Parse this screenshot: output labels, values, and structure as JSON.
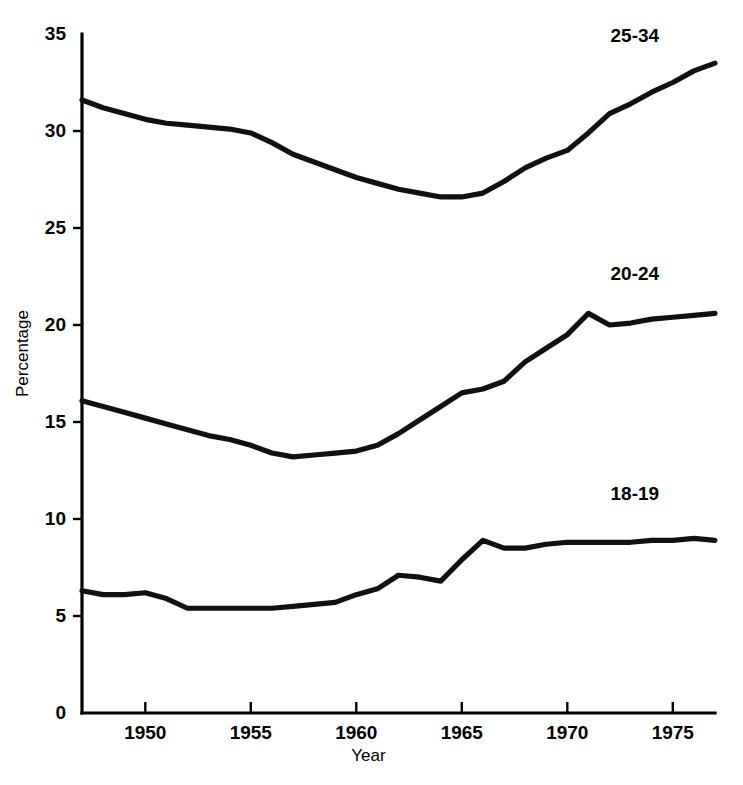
{
  "chart_data": {
    "type": "line",
    "title": "",
    "xlabel": "Year",
    "ylabel": "Percentage",
    "xlim": [
      1947,
      1977
    ],
    "ylim": [
      0,
      35
    ],
    "grid": false,
    "legend_position": "right-of-line-ends",
    "xticks": [
      1950,
      1955,
      1960,
      1965,
      1970,
      1975
    ],
    "xtick_labels": [
      "1950",
      "1955",
      "1960",
      "1965",
      "1970",
      "1975"
    ],
    "yticks": [
      0,
      5,
      10,
      15,
      20,
      25,
      30,
      35
    ],
    "ytick_labels": [
      "0",
      "5",
      "10",
      "15",
      "20",
      "25",
      "30",
      "35"
    ],
    "x": [
      1947,
      1948,
      1949,
      1950,
      1951,
      1952,
      1953,
      1954,
      1955,
      1956,
      1957,
      1958,
      1959,
      1960,
      1961,
      1962,
      1963,
      1964,
      1965,
      1966,
      1967,
      1968,
      1969,
      1970,
      1971,
      1972,
      1973,
      1974,
      1975,
      1976,
      1977
    ],
    "series": [
      {
        "name": "25-34",
        "label": "25-34",
        "label_x": 1973.2,
        "label_y": 34.6,
        "values": [
          31.6,
          31.2,
          30.9,
          30.6,
          30.4,
          30.3,
          30.2,
          30.1,
          29.9,
          29.4,
          28.8,
          28.4,
          28.0,
          27.6,
          27.3,
          27.0,
          26.8,
          26.6,
          26.6,
          26.8,
          27.4,
          28.1,
          28.6,
          29.0,
          29.9,
          30.9,
          31.4,
          32.0,
          32.5,
          33.1,
          33.5
        ]
      },
      {
        "name": "20-24",
        "label": "20-24",
        "label_x": 1973.2,
        "label_y": 22.3,
        "values": [
          16.1,
          15.8,
          15.5,
          15.2,
          14.9,
          14.6,
          14.3,
          14.1,
          13.8,
          13.4,
          13.2,
          13.3,
          13.4,
          13.5,
          13.8,
          14.4,
          15.1,
          15.8,
          16.5,
          16.7,
          17.1,
          18.1,
          18.8,
          19.5,
          20.6,
          20.0,
          20.1,
          20.3,
          20.4,
          20.5,
          20.6
        ]
      },
      {
        "name": "18-19",
        "label": "18-19",
        "label_x": 1973.2,
        "label_y": 11.0,
        "values": [
          6.3,
          6.1,
          6.1,
          6.2,
          5.9,
          5.4,
          5.4,
          5.4,
          5.4,
          5.4,
          5.5,
          5.6,
          5.7,
          6.1,
          6.4,
          7.1,
          7.0,
          6.8,
          7.9,
          8.9,
          8.5,
          8.5,
          8.7,
          8.8,
          8.8,
          8.8,
          8.8,
          8.9,
          8.9,
          9.0,
          8.9
        ]
      }
    ]
  },
  "figure": {
    "plot_left_px": 82,
    "plot_right_px": 715,
    "plot_top_px": 34,
    "plot_bottom_px": 713
  }
}
